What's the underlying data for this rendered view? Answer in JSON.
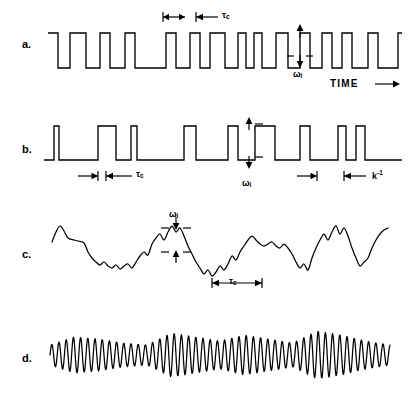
{
  "figure": {
    "background": "#ffffff",
    "ink": "#000000",
    "width": 411,
    "height": 403,
    "panels": [
      {
        "id": "a",
        "label": "a.",
        "label_x": 25,
        "label_y": 45,
        "waveform": "square-wave-random-mark-space",
        "baseline_high_y": 33,
        "baseline_low_y": 68,
        "annotations": [
          {
            "name": "tau-c-tick-a",
            "type": "interval-bracket",
            "text": "",
            "x": 163,
            "y": 20,
            "w": 22
          },
          {
            "name": "tau-c-a",
            "type": "interval-bracket-label",
            "text": "τ",
            "sub": "c",
            "x": 196,
            "y": 20,
            "w": 22
          },
          {
            "name": "omega-i-a",
            "type": "vertical-measure",
            "text": "ω",
            "sub": "i",
            "x": 300,
            "y": 34,
            "h": 28
          }
        ],
        "axis_label": "TIME",
        "axis_arrow": "right-arrow"
      },
      {
        "id": "b",
        "label": "b.",
        "label_x": 25,
        "label_y": 150,
        "waveform": "narrow-pulse-train",
        "baseline_y": 160,
        "pulse_top_y": 126,
        "annotations": [
          {
            "name": "tau-c-tick-b",
            "type": "interval-bracket",
            "text": "",
            "x": 78,
            "y": 176,
            "w": 20
          },
          {
            "name": "tau-c-b",
            "type": "interval-bracket-label",
            "text": "τ",
            "sub": "c",
            "x": 106,
            "y": 176,
            "w": 26
          },
          {
            "name": "omega-i-b",
            "type": "vertical-measure",
            "text": "ω",
            "sub": "i",
            "x": 249,
            "y": 124,
            "h": 40
          },
          {
            "name": "pulse-width-tick-b",
            "type": "interval-bracket",
            "text": "",
            "x": 297,
            "y": 176,
            "w": 20
          },
          {
            "name": "k-inverse-b",
            "type": "interval-bracket-label",
            "text": "k",
            "sup": "-1",
            "x": 344,
            "y": 176,
            "w": 22
          }
        ]
      },
      {
        "id": "c",
        "label": "c.",
        "label_x": 25,
        "label_y": 255,
        "waveform": "random-noise-trace",
        "center_y": 245,
        "annotations": [
          {
            "name": "omega-i-c",
            "type": "vertical-measure-dashed",
            "text": "ω",
            "sub": "i",
            "x": 176,
            "y": 225,
            "h": 32
          },
          {
            "name": "tau-c-c",
            "type": "interval-bracket-double",
            "text": "τ",
            "sub": "c",
            "x": 210,
            "y": 283,
            "w": 50
          }
        ]
      },
      {
        "id": "d",
        "label": "d.",
        "label_x": 25,
        "label_y": 360,
        "waveform": "amplitude-modulated-oscillation",
        "center_y": 355,
        "annotations": []
      }
    ]
  },
  "chart_data": {
    "type": "line",
    "title": "",
    "xlabel": "TIME",
    "ylabel": "",
    "grid": false,
    "legend": "none",
    "series": [
      {
        "name": "a. random telegraph square wave",
        "panel": "a",
        "description": "Two-level square wave with randomly varying mark and space durations; amplitude omega_i, correlation time tau_c.",
        "levels": [
          68,
          33
        ],
        "transitions_x": [
          58,
          70,
          86,
          100,
          110,
          125,
          135,
          166,
          176,
          190,
          200,
          210,
          225,
          238,
          246,
          254,
          262,
          276,
          288,
          300,
          310,
          322,
          332,
          342,
          352,
          368,
          378,
          398
        ],
        "start_level": "high"
      },
      {
        "name": "b. narrow pulse train",
        "panel": "b",
        "description": "Train of rectangular pulses of varying width on a flat baseline; pulse height omega_i, mean spacing tau_c, pulse duration k^-1.",
        "baseline": 160,
        "top": 126,
        "pulses": [
          {
            "x": 54,
            "w": 5
          },
          {
            "x": 98,
            "w": 18
          },
          {
            "x": 131,
            "w": 6
          },
          {
            "x": 184,
            "w": 12
          },
          {
            "x": 228,
            "w": 10
          },
          {
            "x": 255,
            "w": 20
          },
          {
            "x": 300,
            "w": 10
          },
          {
            "x": 338,
            "w": 8
          },
          {
            "x": 356,
            "w": 9
          }
        ]
      },
      {
        "name": "c. random continuous noise",
        "panel": "c",
        "description": "Band-limited random fluctuation about a mean level; rms amplitude omega_i, correlation time tau_c.",
        "center": 245,
        "points": [
          [
            52,
            242
          ],
          [
            56,
            232
          ],
          [
            60,
            226
          ],
          [
            64,
            231
          ],
          [
            68,
            238
          ],
          [
            74,
            240
          ],
          [
            78,
            241
          ],
          [
            84,
            243
          ],
          [
            88,
            252
          ],
          [
            92,
            258
          ],
          [
            96,
            262
          ],
          [
            100,
            265
          ],
          [
            104,
            262
          ],
          [
            108,
            266
          ],
          [
            112,
            268
          ],
          [
            116,
            265
          ],
          [
            120,
            269
          ],
          [
            124,
            266
          ],
          [
            128,
            264
          ],
          [
            132,
            268
          ],
          [
            136,
            262
          ],
          [
            140,
            256
          ],
          [
            144,
            252
          ],
          [
            148,
            255
          ],
          [
            152,
            244
          ],
          [
            156,
            238
          ],
          [
            160,
            234
          ],
          [
            164,
            240
          ],
          [
            168,
            232
          ],
          [
            172,
            226
          ],
          [
            176,
            232
          ],
          [
            180,
            228
          ],
          [
            184,
            236
          ],
          [
            188,
            246
          ],
          [
            192,
            254
          ],
          [
            196,
            262
          ],
          [
            200,
            268
          ],
          [
            204,
            274
          ],
          [
            208,
            270
          ],
          [
            212,
            276
          ],
          [
            216,
            272
          ],
          [
            220,
            266
          ],
          [
            224,
            270
          ],
          [
            228,
            264
          ],
          [
            232,
            256
          ],
          [
            236,
            260
          ],
          [
            240,
            252
          ],
          [
            244,
            246
          ],
          [
            248,
            240
          ],
          [
            252,
            236
          ],
          [
            256,
            240
          ],
          [
            260,
            244
          ],
          [
            264,
            246
          ],
          [
            268,
            244
          ],
          [
            272,
            242
          ],
          [
            276,
            246
          ],
          [
            280,
            248
          ],
          [
            284,
            244
          ],
          [
            288,
            248
          ],
          [
            292,
            254
          ],
          [
            296,
            262
          ],
          [
            300,
            268
          ],
          [
            304,
            264
          ],
          [
            308,
            270
          ],
          [
            312,
            258
          ],
          [
            316,
            248
          ],
          [
            320,
            240
          ],
          [
            324,
            234
          ],
          [
            328,
            240
          ],
          [
            332,
            232
          ],
          [
            336,
            226
          ],
          [
            340,
            234
          ],
          [
            344,
            228
          ],
          [
            348,
            236
          ],
          [
            352,
            248
          ],
          [
            356,
            258
          ],
          [
            360,
            266
          ],
          [
            364,
            262
          ],
          [
            368,
            258
          ],
          [
            372,
            248
          ],
          [
            376,
            240
          ],
          [
            380,
            234
          ],
          [
            384,
            230
          ],
          [
            388,
            228
          ]
        ]
      },
      {
        "name": "d. amplitude-modulated oscillation",
        "panel": "d",
        "description": "Quasi-sinusoidal oscillation with slowly varying envelope amplitude.",
        "center": 355,
        "period_px": 7.2,
        "envelope": [
          10,
          18,
          16,
          12,
          10,
          22,
          18,
          14,
          20,
          16,
          12,
          24,
          20,
          14,
          10
        ]
      }
    ]
  }
}
